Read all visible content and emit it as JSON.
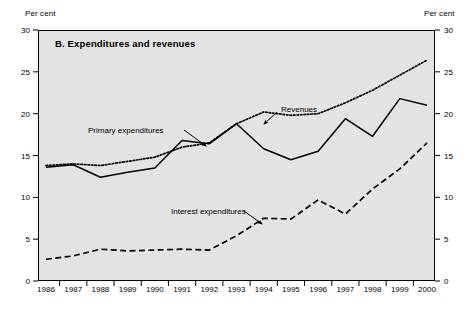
{
  "figure": {
    "panel_letter": "B.",
    "title": "B.  Expenditures and revenues",
    "unit_label_left": "Per cent",
    "unit_label_right": "Per cent",
    "background_color": "#e3e3e3",
    "frame_color": "#000000"
  },
  "chart_data": {
    "type": "line",
    "title": "B.  Expenditures and revenues",
    "xlabel": "",
    "ylabel": "Per cent",
    "ylim": [
      0,
      30
    ],
    "ytick_values": [
      0,
      5,
      10,
      15,
      20,
      25,
      30
    ],
    "ytick_labels": [
      "0",
      "5",
      "10",
      "15",
      "20",
      "25",
      "30"
    ],
    "grid": false,
    "legend_position": "inline-annotations",
    "categories": [
      1986,
      1987,
      1988,
      1989,
      1990,
      1991,
      1992,
      1993,
      1994,
      1995,
      1996,
      1997,
      1998,
      1999,
      2000
    ],
    "xtick_labels": [
      "1986",
      "1987",
      "1988",
      "1989",
      "1990",
      "1991",
      "1992",
      "1993",
      "1994",
      "1995",
      "1996",
      "1997",
      "1998",
      "1999",
      "2000"
    ],
    "series": [
      {
        "name": "Primary expenditures",
        "style": "solid",
        "color": "#000000",
        "values": [
          13.6,
          13.9,
          12.4,
          13.0,
          13.5,
          16.8,
          16.4,
          18.8,
          15.8,
          14.5,
          15.5,
          19.4,
          17.3,
          21.8,
          21.0
        ]
      },
      {
        "name": "Revenues",
        "style": "dotted",
        "color": "#000000",
        "values": [
          13.8,
          14.0,
          13.8,
          14.3,
          14.8,
          16.0,
          16.5,
          18.8,
          20.2,
          19.8,
          20.0,
          21.3,
          22.8,
          24.6,
          26.4
        ]
      },
      {
        "name": "Interest expenditures",
        "style": "dashed",
        "color": "#000000",
        "values": [
          2.6,
          3.0,
          3.8,
          3.6,
          3.7,
          3.8,
          3.7,
          5.4,
          7.5,
          7.4,
          9.7,
          8.0,
          11.0,
          13.4,
          16.5
        ]
      }
    ],
    "annotations": [
      {
        "text": "Primary expenditures",
        "target_series": "Primary expenditures"
      },
      {
        "text": "Revenues",
        "target_series": "Revenues"
      },
      {
        "text": "Interest expenditures",
        "target_series": "Interest expenditures"
      }
    ]
  }
}
